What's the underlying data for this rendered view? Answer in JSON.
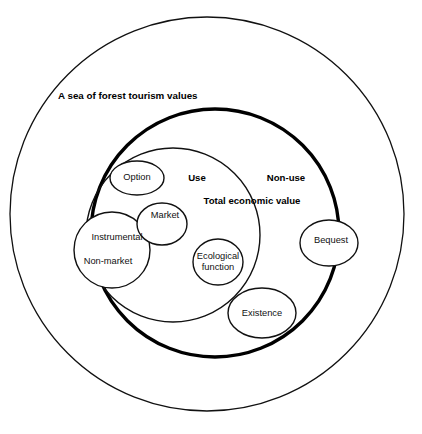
{
  "diagram": {
    "title": "A sea of forest tourism values",
    "domain_labels": {
      "use": "Use",
      "non_use": "Non-use",
      "total_economic_value": "Total economic value"
    },
    "bubbles": {
      "option": "Option",
      "market": "Market",
      "instrumental": "Instrumental",
      "non_market": "Non-market",
      "ecological_function_line1": "Ecological",
      "ecological_function_line2": "function",
      "existence": "Existence",
      "bequest": "Bequest"
    },
    "colors": {
      "stroke": "#111111",
      "emphasis_stroke": "#000000",
      "background": "#ffffff"
    }
  }
}
